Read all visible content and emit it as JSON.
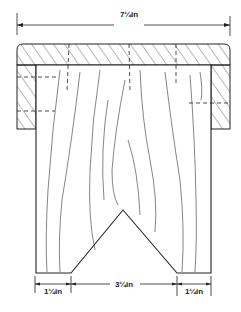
{
  "diagram": {
    "type": "technical-drawing",
    "colors": {
      "line": "#222222",
      "background": "#ffffff"
    },
    "dimensions": {
      "top_width": "7¼in",
      "bottom_left": "1¼in",
      "bottom_middle": "3¼in",
      "bottom_right": "1¼in"
    }
  }
}
